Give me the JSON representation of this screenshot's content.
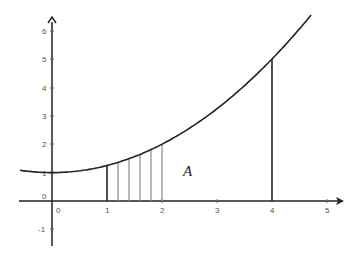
{
  "chart_data": {
    "type": "line",
    "title": "",
    "function": "y = 1 + x^2/4",
    "xlabel": "",
    "ylabel": "",
    "xlim": [
      -0.6,
      5.3
    ],
    "ylim": [
      -1.5,
      6.5
    ],
    "grid": false,
    "x_ticks": [
      0,
      1,
      2,
      3,
      4,
      5
    ],
    "x_tick_labels": [
      "0",
      "1",
      "2",
      "3",
      "4",
      "5"
    ],
    "y_ticks": [
      -1,
      0,
      1,
      2,
      3,
      4,
      5,
      6
    ],
    "y_tick_labels": [
      "-1",
      "0",
      "1",
      "2",
      "3",
      "4",
      "5",
      "6"
    ],
    "series": [
      {
        "name": "curve",
        "x": [
          -0.58,
          0,
          0.5,
          1,
          1.5,
          2,
          2.5,
          3,
          3.5,
          4,
          4.5,
          4.71
        ],
        "y": [
          1.08,
          1.0,
          1.06,
          1.25,
          1.56,
          2.0,
          2.56,
          3.25,
          4.06,
          5.0,
          6.06,
          6.55
        ]
      }
    ],
    "vertical_segments": {
      "bounds": [
        {
          "x": 1,
          "y_top": 1.25,
          "style": "thick-black"
        },
        {
          "x": 4,
          "y_top": 5.0,
          "style": "thick-black"
        }
      ],
      "strips": [
        {
          "x": 1.2,
          "y_top": 1.36,
          "style": "thin-gray"
        },
        {
          "x": 1.4,
          "y_top": 1.49,
          "style": "thin-gray"
        },
        {
          "x": 1.6,
          "y_top": 1.64,
          "style": "thin-gray"
        },
        {
          "x": 1.8,
          "y_top": 1.81,
          "style": "thin-gray"
        },
        {
          "x": 2.0,
          "y_top": 2.0,
          "style": "thin-gray"
        }
      ]
    },
    "annotations": [
      {
        "text": "A",
        "x": 2.4,
        "y": 1.1,
        "italic": true
      }
    ]
  },
  "labels": {
    "region": "A",
    "x0": "0",
    "x1": "1",
    "x2": "2",
    "x3": "3",
    "x4": "4",
    "x5": "5",
    "ym1": "-1",
    "y0": "0",
    "y1": "1",
    "y2": "2",
    "y3": "3",
    "y4": "4",
    "y5": "5",
    "y6": "6"
  },
  "colors": {
    "axis": "#222222",
    "curve": "#222222",
    "strip": "#888888",
    "text": "#555555"
  }
}
